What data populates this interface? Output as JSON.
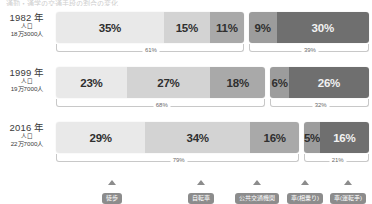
{
  "cut_title": "通勤・通学の交通手段の割合の変化",
  "legend": [
    {
      "label": "徒歩",
      "color": "#e6e6e6",
      "x": 112
    },
    {
      "label": "自転車",
      "color": "#d2d2d2",
      "x": 201
    },
    {
      "label": "公共交通機関",
      "color": "#a8a8a8",
      "x": 257
    },
    {
      "label": "車(相乗り)",
      "color": "#9b9b9b",
      "x": 305
    },
    {
      "label": "車(運転手)",
      "color": "#6e6e6e",
      "x": 348
    }
  ],
  "colors": {
    "walk": "#e9e9e9",
    "bike": "#d3d3d3",
    "transit": "#a9a9a9",
    "carpool": "#9c9c9c",
    "driver": "#6f6f6f",
    "pill": "#8c8c8c",
    "bracket": "#c8c8c8"
  },
  "rows": [
    {
      "year": "1982 年",
      "pop_caption": "人口",
      "population": "18万3000人",
      "left_total": "61%",
      "right_total": "39%",
      "left": [
        {
          "name": "walk",
          "value": "35%",
          "pct": 35,
          "tone": "light"
        },
        {
          "name": "bike",
          "value": "15%",
          "pct": 15,
          "tone": "light"
        },
        {
          "name": "transit",
          "value": "11%",
          "pct": 11,
          "tone": "light"
        }
      ],
      "right": [
        {
          "name": "carpool",
          "value": "9%",
          "pct": 9,
          "tone": "light"
        },
        {
          "name": "driver",
          "value": "30%",
          "pct": 30,
          "tone": "dark"
        }
      ]
    },
    {
      "year": "1999 年",
      "pop_caption": "人口",
      "population": "19万7000人",
      "left_total": "68%",
      "right_total": "32%",
      "left": [
        {
          "name": "walk",
          "value": "23%",
          "pct": 23,
          "tone": "light"
        },
        {
          "name": "bike",
          "value": "27%",
          "pct": 27,
          "tone": "light"
        },
        {
          "name": "transit",
          "value": "18%",
          "pct": 18,
          "tone": "light"
        }
      ],
      "right": [
        {
          "name": "carpool",
          "value": "6%",
          "pct": 6,
          "tone": "light"
        },
        {
          "name": "driver",
          "value": "26%",
          "pct": 26,
          "tone": "dark"
        }
      ]
    },
    {
      "year": "2016 年",
      "pop_caption": "人口",
      "population": "22万7000人",
      "left_total": "79%",
      "right_total": "21%",
      "left": [
        {
          "name": "walk",
          "value": "29%",
          "pct": 29,
          "tone": "light"
        },
        {
          "name": "bike",
          "value": "34%",
          "pct": 34,
          "tone": "light"
        },
        {
          "name": "transit",
          "value": "16%",
          "pct": 16,
          "tone": "light"
        }
      ],
      "right": [
        {
          "name": "carpool",
          "value": "5%",
          "pct": 5,
          "tone": "light"
        },
        {
          "name": "driver",
          "value": "16%",
          "pct": 16,
          "tone": "dark"
        }
      ]
    }
  ],
  "chart_data": {
    "type": "bar",
    "title": "通勤・通学の交通手段の割合の変化",
    "subtype": "stacked-100-split",
    "categories": [
      "1982 年",
      "1999 年",
      "2016 年"
    ],
    "xlabel": "",
    "ylabel": "",
    "xlim": [
      0,
      100
    ],
    "grid": false,
    "legend_position": "bottom",
    "series": [
      {
        "name": "徒歩",
        "values": [
          35,
          23,
          29
        ]
      },
      {
        "name": "自転車",
        "values": [
          15,
          27,
          34
        ]
      },
      {
        "name": "公共交通機関",
        "values": [
          11,
          18,
          16
        ]
      },
      {
        "name": "車(相乗り)",
        "values": [
          9,
          6,
          5
        ]
      },
      {
        "name": "車(運転手)",
        "values": [
          30,
          26,
          16
        ]
      }
    ],
    "group_totals": [
      {
        "category": "1982 年",
        "left": 61,
        "right": 39
      },
      {
        "category": "1999 年",
        "left": 68,
        "right": 32
      },
      {
        "category": "2016 年",
        "left": 79,
        "right": 21
      }
    ],
    "annotations": [
      {
        "category": "1982 年",
        "population": "18万3000人"
      },
      {
        "category": "1999 年",
        "population": "19万7000人"
      },
      {
        "category": "2016 年",
        "population": "22万7000人"
      }
    ]
  }
}
